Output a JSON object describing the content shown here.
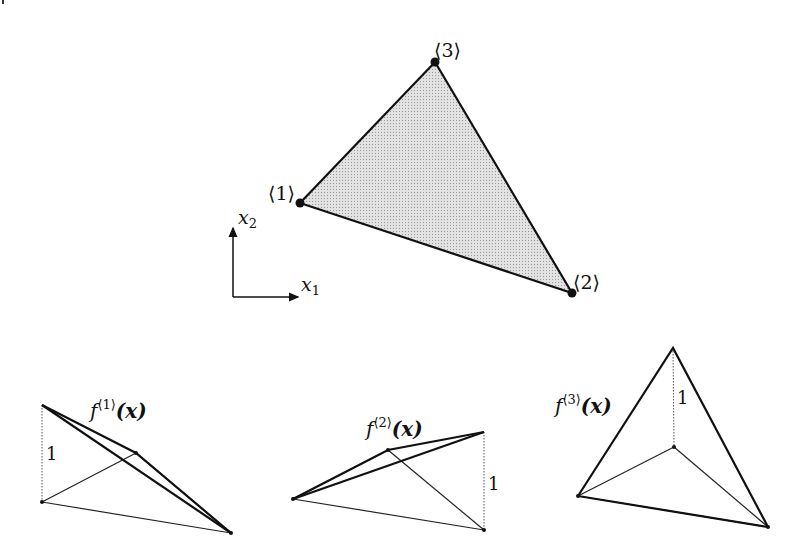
{
  "figure": {
    "main_triangle": {
      "vertices": [
        {
          "id": "1",
          "label": "⟨1⟩",
          "x": 300,
          "y": 203
        },
        {
          "id": "2",
          "label": "⟨2⟩",
          "x": 572,
          "y": 293
        },
        {
          "id": "3",
          "label": "⟨3⟩",
          "x": 435,
          "y": 62
        }
      ],
      "fill_color": "#d4d4d4",
      "edge_color": "#111111"
    },
    "axes": {
      "x_label": "x",
      "x_sub": "1",
      "y_label": "x",
      "y_sub": "2"
    },
    "shape_functions": [
      {
        "name": "f",
        "sup": "⟨1⟩",
        "arg": "(x)",
        "height_label": "1"
      },
      {
        "name": "f",
        "sup": "⟨2⟩",
        "arg": "(x)",
        "height_label": "1"
      },
      {
        "name": "f",
        "sup": "⟨3⟩",
        "arg": "(x)",
        "height_label": "1"
      }
    ]
  }
}
